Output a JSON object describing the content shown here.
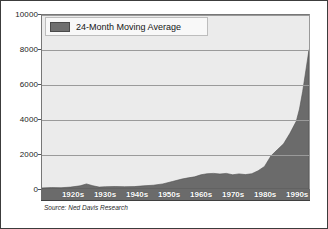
{
  "chart_data": {
    "type": "area",
    "title": "",
    "subtitle": "",
    "xlabel": "",
    "ylabel": "",
    "ylim": [
      0,
      10000
    ],
    "xlim": [
      1915,
      1999
    ],
    "grid": true,
    "legend_position": "top-left",
    "series": [
      {
        "name": "24-Month Moving Average",
        "color": "#6b6b6b",
        "x": [
          1915,
          1918,
          1921,
          1924,
          1927,
          1929,
          1931,
          1933,
          1935,
          1938,
          1941,
          1944,
          1947,
          1950,
          1953,
          1956,
          1959,
          1961,
          1963,
          1965,
          1967,
          1969,
          1971,
          1973,
          1975,
          1977,
          1979,
          1981,
          1983,
          1985,
          1987,
          1989,
          1991,
          1993,
          1995,
          1996,
          1997,
          1998,
          1999
        ],
        "values": [
          60,
          80,
          75,
          110,
          180,
          290,
          190,
          110,
          130,
          145,
          130,
          140,
          180,
          220,
          290,
          430,
          570,
          640,
          700,
          820,
          880,
          900,
          860,
          900,
          820,
          870,
          830,
          880,
          1050,
          1300,
          1900,
          2250,
          2600,
          3200,
          3900,
          4600,
          5600,
          6800,
          8000
        ]
      }
    ],
    "y_ticks": [
      {
        "value": 0,
        "label": "0"
      },
      {
        "value": 2000,
        "label": "2000"
      },
      {
        "value": 4000,
        "label": "4000"
      },
      {
        "value": 6000,
        "label": "6000"
      },
      {
        "value": 8000,
        "label": "8000"
      },
      {
        "value": 10000,
        "label": "10000"
      }
    ],
    "x_ticks": [
      {
        "value": 1925,
        "label": "1920s"
      },
      {
        "value": 1935,
        "label": "1930s"
      },
      {
        "value": 1945,
        "label": "1940s"
      },
      {
        "value": 1955,
        "label": "1950s"
      },
      {
        "value": 1965,
        "label": "1960s"
      },
      {
        "value": 1975,
        "label": "1970s"
      },
      {
        "value": 1985,
        "label": "1980s"
      },
      {
        "value": 1995,
        "label": "1990s"
      }
    ],
    "annotations": [
      {
        "name": "source",
        "text": "Source: Ned Davis Research"
      }
    ]
  },
  "legend": {
    "entries": [
      {
        "label": "24-Month Moving Average",
        "color": "#6b6b6b"
      }
    ]
  },
  "source": {
    "text": "Source: Ned Davis Research"
  },
  "colors": {
    "area_fill": "#6b6b6b",
    "plot_background": "#ebebeb",
    "gridline": "#9a9a9a",
    "axis_band": "#6b6b6b",
    "axis_text": "#1a1a1a",
    "x_label_text": "#ffffff",
    "frame_border": "#3c3c3c"
  }
}
